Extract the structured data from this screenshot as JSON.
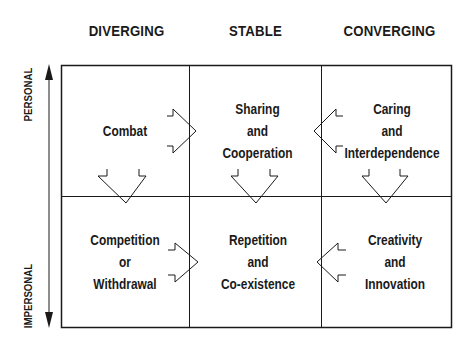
{
  "columns": [
    {
      "label": "DIVERGING"
    },
    {
      "label": "STABLE"
    },
    {
      "label": "CONVERGING"
    }
  ],
  "axis": {
    "top_label": "PERSONAL",
    "bottom_label": "IMPERSONAL"
  },
  "cells": {
    "personal_diverging": {
      "lines": [
        "Combat"
      ]
    },
    "personal_stable": {
      "lines": [
        "Sharing",
        "and",
        "Cooperation"
      ]
    },
    "personal_converging": {
      "lines": [
        "Caring",
        "and",
        "Interdependence"
      ]
    },
    "impersonal_diverging": {
      "lines": [
        "Competition",
        "or",
        "Withdrawal"
      ]
    },
    "impersonal_stable": {
      "lines": [
        "Repetition",
        "and",
        "Co-existence"
      ]
    },
    "impersonal_converging": {
      "lines": [
        "Creativity",
        "and",
        "Innovation"
      ]
    }
  },
  "arrows": [
    {
      "from": "Combat",
      "to": "Sharing and Cooperation",
      "direction": "right"
    },
    {
      "from": "Caring and Interdependence",
      "to": "Sharing and Cooperation",
      "direction": "left"
    },
    {
      "from": "Competition or Withdrawal",
      "to": "Repetition and Co-existence",
      "direction": "right"
    },
    {
      "from": "Creativity and Innovation",
      "to": "Repetition and Co-existence",
      "direction": "left"
    },
    {
      "from": "Combat",
      "to": "Competition or Withdrawal",
      "direction": "down"
    },
    {
      "from": "Sharing and Cooperation",
      "to": "Repetition and Co-existence",
      "direction": "down"
    },
    {
      "from": "Caring and Interdependence",
      "to": "Creativity and Innovation",
      "direction": "down"
    }
  ],
  "colors": {
    "ink": "#1a1a1a",
    "background": "#ffffff"
  }
}
